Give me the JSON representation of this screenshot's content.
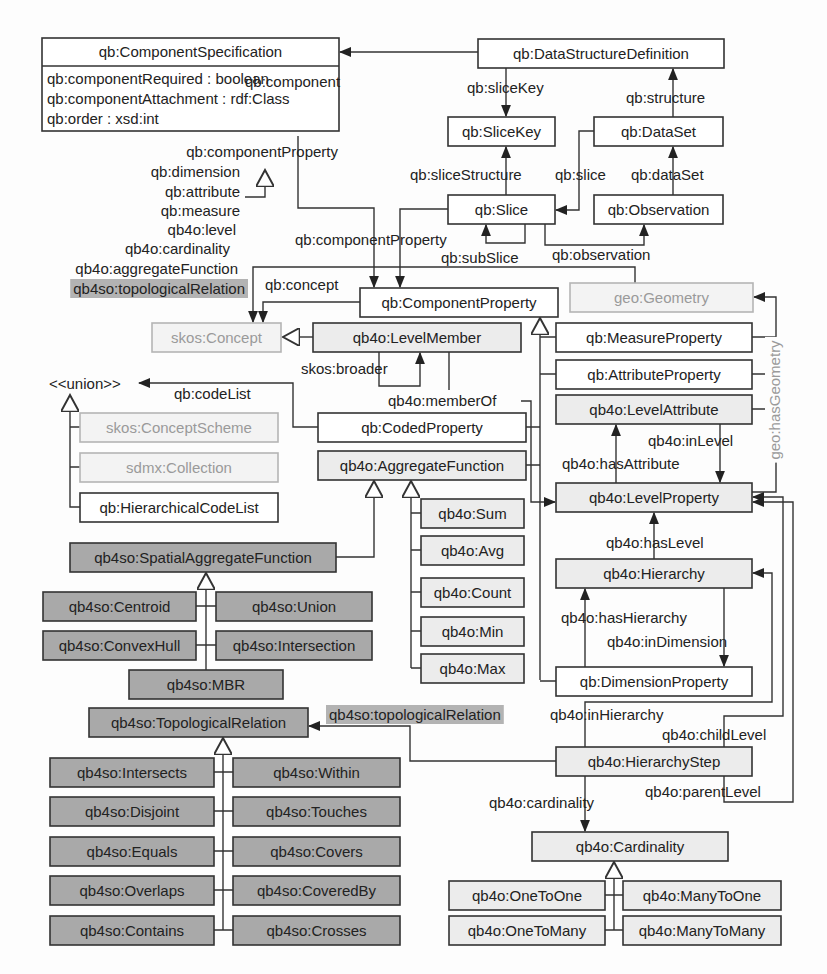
{
  "diagram": {
    "classes": [
      {
        "id": "ComponentSpecification",
        "label": "qb:ComponentSpecification",
        "style": "white",
        "x": 42,
        "y": 38,
        "w": 297,
        "h": 28,
        "attributes": [
          "qb:componentRequired : boolean",
          "qb:componentAttachment : rdf:Class",
          "qb:order : xsd:int"
        ]
      },
      {
        "id": "DataStructureDefinition",
        "label": "qb:DataStructureDefinition",
        "style": "white",
        "x": 478,
        "y": 39,
        "w": 246,
        "h": 29
      },
      {
        "id": "SliceKey",
        "label": "qb:SliceKey",
        "style": "white",
        "x": 448,
        "y": 117,
        "w": 107,
        "h": 29
      },
      {
        "id": "DataSet",
        "label": "qb:DataSet",
        "style": "white",
        "x": 594,
        "y": 117,
        "w": 129,
        "h": 29
      },
      {
        "id": "Slice",
        "label": "qb:Slice",
        "style": "white",
        "x": 448,
        "y": 195,
        "w": 107,
        "h": 29
      },
      {
        "id": "Observation",
        "label": "qb:Observation",
        "style": "white",
        "x": 594,
        "y": 195,
        "w": 129,
        "h": 29
      },
      {
        "id": "ComponentProperty",
        "label": "qb:ComponentProperty",
        "style": "white",
        "x": 360,
        "y": 288,
        "w": 198,
        "h": 29
      },
      {
        "id": "Geometry",
        "label": "geo:Geometry",
        "style": "ext",
        "x": 570,
        "y": 283,
        "w": 183,
        "h": 29
      },
      {
        "id": "Concept",
        "label": "skos:Concept",
        "style": "ext",
        "x": 152,
        "y": 323,
        "w": 129,
        "h": 29
      },
      {
        "id": "LevelMember",
        "label": "qb4o:LevelMember",
        "style": "light",
        "x": 313,
        "y": 323,
        "w": 208,
        "h": 29
      },
      {
        "id": "MeasureProperty",
        "label": "qb:MeasureProperty",
        "style": "white",
        "x": 556,
        "y": 323,
        "w": 196,
        "h": 29
      },
      {
        "id": "AttributeProperty",
        "label": "qb:AttributeProperty",
        "style": "white",
        "x": 556,
        "y": 360,
        "w": 196,
        "h": 29
      },
      {
        "id": "LevelAttribute",
        "label": "qb4o:LevelAttribute",
        "style": "light",
        "x": 556,
        "y": 395,
        "w": 196,
        "h": 29
      },
      {
        "id": "CodedProperty",
        "label": "qb:CodedProperty",
        "style": "white",
        "x": 318,
        "y": 413,
        "w": 208,
        "h": 29
      },
      {
        "id": "ConceptScheme",
        "label": "skos:ConceptScheme",
        "style": "ext",
        "x": 80,
        "y": 413,
        "w": 198,
        "h": 29
      },
      {
        "id": "Collection",
        "label": "sdmx:Collection",
        "style": "ext",
        "x": 80,
        "y": 453,
        "w": 198,
        "h": 29
      },
      {
        "id": "AggregateFunction",
        "label": "qb4o:AggregateFunction",
        "style": "light",
        "x": 318,
        "y": 451,
        "w": 208,
        "h": 29
      },
      {
        "id": "HierarchicalCodeList",
        "label": "qb:HierarchicalCodeList",
        "style": "white",
        "x": 80,
        "y": 493,
        "w": 198,
        "h": 29
      },
      {
        "id": "LevelProperty",
        "label": "qb4o:LevelProperty",
        "style": "light",
        "x": 556,
        "y": 483,
        "w": 196,
        "h": 29
      },
      {
        "id": "Sum",
        "label": "qb4o:Sum",
        "style": "light",
        "x": 421,
        "y": 499,
        "w": 103,
        "h": 29
      },
      {
        "id": "Avg",
        "label": "qb4o:Avg",
        "style": "light",
        "x": 421,
        "y": 536,
        "w": 103,
        "h": 29
      },
      {
        "id": "SpatialAggregateFunction",
        "label": "qb4so:SpatialAggregateFunction",
        "style": "dark",
        "x": 70,
        "y": 543,
        "w": 266,
        "h": 29
      },
      {
        "id": "Hierarchy",
        "label": "qb4o:Hierarchy",
        "style": "light",
        "x": 556,
        "y": 559,
        "w": 196,
        "h": 29
      },
      {
        "id": "Count",
        "label": "qb4o:Count",
        "style": "light",
        "x": 421,
        "y": 578,
        "w": 103,
        "h": 29
      },
      {
        "id": "Centroid",
        "label": "qb4so:Centroid",
        "style": "dark",
        "x": 43,
        "y": 592,
        "w": 153,
        "h": 29
      },
      {
        "id": "Union",
        "label": "qb4so:Union",
        "style": "dark",
        "x": 216,
        "y": 592,
        "w": 156,
        "h": 29
      },
      {
        "id": "Min",
        "label": "qb4o:Min",
        "style": "light",
        "x": 421,
        "y": 617,
        "w": 103,
        "h": 29
      },
      {
        "id": "ConvexHull",
        "label": "qb4so:ConvexHull",
        "style": "dark",
        "x": 43,
        "y": 631,
        "w": 153,
        "h": 29
      },
      {
        "id": "Intersection",
        "label": "qb4so:Intersection",
        "style": "dark",
        "x": 216,
        "y": 631,
        "w": 156,
        "h": 29
      },
      {
        "id": "Max",
        "label": "qb4o:Max",
        "style": "light",
        "x": 421,
        "y": 654,
        "w": 103,
        "h": 29
      },
      {
        "id": "DimensionProperty",
        "label": "qb:DimensionProperty",
        "style": "white",
        "x": 556,
        "y": 667,
        "w": 196,
        "h": 29
      },
      {
        "id": "MBR",
        "label": "qb4so:MBR",
        "style": "dark",
        "x": 129,
        "y": 670,
        "w": 154,
        "h": 29
      },
      {
        "id": "TopologicalRelation",
        "label": "qb4so:TopologicalRelation",
        "style": "dark",
        "x": 89,
        "y": 708,
        "w": 219,
        "h": 29
      },
      {
        "id": "HierarchyStep",
        "label": "qb4o:HierarchyStep",
        "style": "light",
        "x": 556,
        "y": 747,
        "w": 196,
        "h": 29
      },
      {
        "id": "Intersects",
        "label": "qb4so:Intersects",
        "style": "dark",
        "x": 50,
        "y": 758,
        "w": 164,
        "h": 29
      },
      {
        "id": "Within",
        "label": "qb4so:Within",
        "style": "dark",
        "x": 233,
        "y": 758,
        "w": 167,
        "h": 29
      },
      {
        "id": "Disjoint",
        "label": "qb4so:Disjoint",
        "style": "dark",
        "x": 50,
        "y": 797,
        "w": 164,
        "h": 29
      },
      {
        "id": "Touches",
        "label": "qb4so:Touches",
        "style": "dark",
        "x": 233,
        "y": 797,
        "w": 167,
        "h": 29
      },
      {
        "id": "Cardinality",
        "label": "qb4o:Cardinality",
        "style": "light",
        "x": 532,
        "y": 832,
        "w": 196,
        "h": 29
      },
      {
        "id": "Equals",
        "label": "qb4so:Equals",
        "style": "dark",
        "x": 50,
        "y": 837,
        "w": 164,
        "h": 29
      },
      {
        "id": "Covers",
        "label": "qb4so:Covers",
        "style": "dark",
        "x": 233,
        "y": 837,
        "w": 167,
        "h": 29
      },
      {
        "id": "OneToOne",
        "label": "qb4o:OneToOne",
        "style": "light",
        "x": 449,
        "y": 881,
        "w": 156,
        "h": 29
      },
      {
        "id": "ManyToOne",
        "label": "qb4o:ManyToOne",
        "style": "light",
        "x": 623,
        "y": 881,
        "w": 158,
        "h": 29
      },
      {
        "id": "Overlaps",
        "label": "qb4so:Overlaps",
        "style": "dark",
        "x": 50,
        "y": 876,
        "w": 164,
        "h": 29
      },
      {
        "id": "CoveredBy",
        "label": "qb4so:CoveredBy",
        "style": "dark",
        "x": 233,
        "y": 876,
        "w": 167,
        "h": 29
      },
      {
        "id": "OneToMany",
        "label": "qb4o:OneToMany",
        "style": "light",
        "x": 449,
        "y": 916,
        "w": 156,
        "h": 29
      },
      {
        "id": "ManyToMany",
        "label": "qb4o:ManyToMany",
        "style": "light",
        "x": 623,
        "y": 916,
        "w": 158,
        "h": 29
      },
      {
        "id": "Contains",
        "label": "qb4so:Contains",
        "style": "dark",
        "x": 50,
        "y": 916,
        "w": 164,
        "h": 29
      },
      {
        "id": "Crosses",
        "label": "qb4so:Crosses",
        "style": "dark",
        "x": 233,
        "y": 916,
        "w": 167,
        "h": 29
      }
    ],
    "labels": [
      {
        "id": "component",
        "text": "qb:component",
        "x": 245,
        "y": 87,
        "anchor": "start"
      },
      {
        "id": "sliceKey",
        "text": "qb:sliceKey",
        "x": 467,
        "y": 93,
        "anchor": "start"
      },
      {
        "id": "structure",
        "text": "qb:structure",
        "x": 626,
        "y": 103,
        "anchor": "start"
      },
      {
        "id": "componentProperty1",
        "text": "qb:componentProperty",
        "x": 338,
        "y": 157,
        "anchor": "end"
      },
      {
        "id": "dimension",
        "text": "qb:dimension",
        "x": 240,
        "y": 177,
        "anchor": "end"
      },
      {
        "id": "attribute",
        "text": "qb:attribute",
        "x": 240,
        "y": 197,
        "anchor": "end"
      },
      {
        "id": "measure",
        "text": "qb:measure",
        "x": 240,
        "y": 216,
        "anchor": "end"
      },
      {
        "id": "level",
        "text": "qb4o:level",
        "x": 236,
        "y": 235,
        "anchor": "end"
      },
      {
        "id": "cardinalityProp",
        "text": "qb4o:cardinality",
        "x": 230,
        "y": 254,
        "anchor": "end"
      },
      {
        "id": "aggregateFunction",
        "text": "qb4o:aggregateFunction",
        "x": 238,
        "y": 274,
        "anchor": "end"
      },
      {
        "id": "topologicalRelation1",
        "text": "qb4so:topologicalRelation",
        "x": 245,
        "y": 294,
        "anchor": "end",
        "highlight": true
      },
      {
        "id": "sliceStructure",
        "text": "qb:sliceStructure",
        "x": 410,
        "y": 180,
        "anchor": "start"
      },
      {
        "id": "slice",
        "text": "qb:slice",
        "x": 555,
        "y": 180,
        "anchor": "start"
      },
      {
        "id": "dataSet",
        "text": "qb:dataSet",
        "x": 631,
        "y": 180,
        "anchor": "start"
      },
      {
        "id": "componentProperty2",
        "text": "qb:componentProperty",
        "x": 295,
        "y": 245,
        "anchor": "start"
      },
      {
        "id": "subSlice",
        "text": "qb:subSlice",
        "x": 441,
        "y": 263,
        "anchor": "start"
      },
      {
        "id": "observation",
        "text": "qb:observation",
        "x": 552,
        "y": 260,
        "anchor": "start"
      },
      {
        "id": "concept",
        "text": "qb:concept",
        "x": 265,
        "y": 290,
        "anchor": "start"
      },
      {
        "id": "broader",
        "text": "skos:broader",
        "x": 301,
        "y": 374,
        "anchor": "start"
      },
      {
        "id": "union",
        "text": "<<union>>",
        "x": 49,
        "y": 389,
        "anchor": "start"
      },
      {
        "id": "codeList",
        "text": "qb:codeList",
        "x": 174,
        "y": 399,
        "anchor": "start"
      },
      {
        "id": "memberOf",
        "text": "qb4o:memberOf",
        "x": 388,
        "y": 406,
        "anchor": "start"
      },
      {
        "id": "inLevel",
        "text": "qb4o:inLevel",
        "x": 648,
        "y": 446,
        "anchor": "start"
      },
      {
        "id": "hasAttribute",
        "text": "qb4o:hasAttribute",
        "x": 562,
        "y": 469,
        "anchor": "start"
      },
      {
        "id": "hasLevel",
        "text": "qb4o:hasLevel",
        "x": 606,
        "y": 548,
        "anchor": "start"
      },
      {
        "id": "hasHierarchy",
        "text": "qb4o:hasHierarchy",
        "x": 561,
        "y": 623,
        "anchor": "start"
      },
      {
        "id": "inDimension",
        "text": "qb4o:inDimension",
        "x": 607,
        "y": 647,
        "anchor": "start"
      },
      {
        "id": "topologicalRelation2",
        "text": "qb4so:topologicalRelation",
        "x": 329,
        "y": 720,
        "anchor": "start",
        "highlight": true
      },
      {
        "id": "inHierarchy",
        "text": "qb4o:inHierarchy",
        "x": 550,
        "y": 720,
        "anchor": "start"
      },
      {
        "id": "childLevel",
        "text": "qb4o:childLevel",
        "x": 662,
        "y": 740,
        "anchor": "start"
      },
      {
        "id": "parentLevel",
        "text": "qb4o:parentLevel",
        "x": 645,
        "y": 797,
        "anchor": "start"
      },
      {
        "id": "cardinalityRel",
        "text": "qb4o:cardinality",
        "x": 489,
        "y": 808,
        "anchor": "start"
      },
      {
        "id": "hasGeometry",
        "text": "geo:hasGeometry",
        "x": 775,
        "y": 400,
        "anchor": "middle",
        "vertical": true,
        "ext": true
      }
    ]
  }
}
